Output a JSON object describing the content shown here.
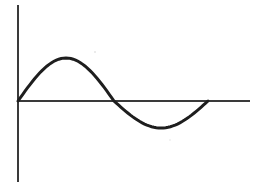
{
  "diagram": {
    "type": "sine-wave-sketch",
    "title": "",
    "colors": {
      "background": "#ffffff",
      "axis": "#3a3a3a",
      "curve": "#1e1e1e"
    },
    "axes": {
      "vertical": {
        "x": 18,
        "y_top": 5,
        "y_bottom": 182,
        "label": ""
      },
      "horizontal": {
        "y": 101,
        "x_left": 18,
        "x_right": 250,
        "label": ""
      }
    },
    "curve": {
      "description": "One period of a wave: positive hump then shallower negative hump",
      "start": {
        "x": 18,
        "y": 101
      },
      "peak": {
        "x": 67,
        "y": 58
      },
      "zero_crossing": {
        "x": 114,
        "y": 101
      },
      "trough": {
        "x": 163,
        "y": 128
      },
      "end": {
        "x": 208,
        "y": 101
      }
    }
  }
}
